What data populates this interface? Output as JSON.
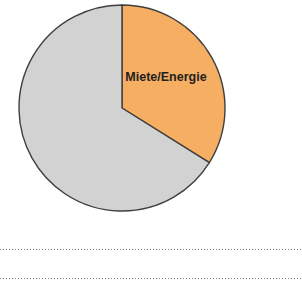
{
  "chart_data": {
    "type": "pie",
    "title": "",
    "subtitle": "",
    "xlabel": "",
    "ylabel": "",
    "grid": false,
    "legend_position": "none",
    "start_angle_deg": 0,
    "direction": "clockwise",
    "categories": [
      "Miete/Energie",
      "Sonstige"
    ],
    "values": [
      34,
      66
    ],
    "slices": [
      {
        "label": "Miete/Energie",
        "value": 34,
        "percent": 34,
        "angle_deg": 122,
        "color": "#F5AE62",
        "stroke": "#3f3f3f",
        "label_visible": true,
        "label_x": 166,
        "label_y": 78
      },
      {
        "label": "",
        "value": 66,
        "percent": 66,
        "angle_deg": 238,
        "color": "#D2D2D2",
        "stroke": "#3f3f3f",
        "label_visible": false,
        "label_x": 0,
        "label_y": 0
      }
    ],
    "geometry": {
      "center_x": 122,
      "center_y": 108,
      "radius": 103
    },
    "colors": {
      "accent": "#F5AE62",
      "secondary": "#D2D2D2",
      "outline": "#3f3f3f",
      "label_text": "#231f20",
      "background": "#ffffff",
      "rule": "#7a7a7a"
    }
  },
  "rules": {
    "rule_1_label": "",
    "rule_2_label": ""
  }
}
